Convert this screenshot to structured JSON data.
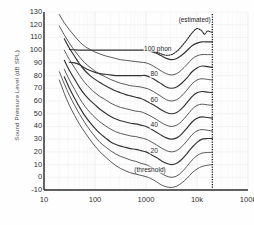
{
  "chart_data": {
    "type": "line",
    "title": "",
    "xlabel": "",
    "ylabel": "Sound Pressure Level (dB SPL)",
    "xscale": "log",
    "xlim": [
      10,
      100000
    ],
    "ylim": [
      -10,
      130
    ],
    "grid": true,
    "legend": "none",
    "xticks": [
      {
        "value": 10,
        "label": "10"
      },
      {
        "value": 100,
        "label": "100"
      },
      {
        "value": 1000,
        "label": "1000"
      },
      {
        "value": 10000,
        "label": "10k"
      },
      {
        "value": 100000,
        "label": "100k"
      }
    ],
    "yticks": [
      {
        "value": 130,
        "label": "130"
      },
      {
        "value": 120,
        "label": "120"
      },
      {
        "value": 110,
        "label": "110"
      },
      {
        "value": 100,
        "label": "100"
      },
      {
        "value": 90,
        "label": "90"
      },
      {
        "value": 80,
        "label": "80"
      },
      {
        "value": 70,
        "label": "70"
      },
      {
        "value": 60,
        "label": "60"
      },
      {
        "value": 50,
        "label": "50"
      },
      {
        "value": 40,
        "label": "40"
      },
      {
        "value": 30,
        "label": "30"
      },
      {
        "value": 20,
        "label": "20"
      },
      {
        "value": 10,
        "label": "10"
      },
      {
        "value": 0,
        "label": "0"
      },
      {
        "value": -10,
        "label": "-10"
      }
    ],
    "annotations": [
      {
        "name": "estimated-note",
        "text": "(estimated)",
        "x": 9000,
        "y": 124
      },
      {
        "name": "label-100-phon",
        "text": "100 phon",
        "x": 1700,
        "y": 101
      },
      {
        "name": "label-80-phon",
        "text": "80",
        "x": 1450,
        "y": 81
      },
      {
        "name": "label-60-phon",
        "text": "60",
        "x": 1450,
        "y": 61
      },
      {
        "name": "label-40-phon",
        "text": "40",
        "x": 1450,
        "y": 41
      },
      {
        "name": "label-20-phon",
        "text": "20",
        "x": 1450,
        "y": 21
      },
      {
        "name": "label-threshold",
        "text": "(threshold)",
        "x": 1200,
        "y": 6
      }
    ],
    "series": [
      {
        "name": "100 phon",
        "style": "solid",
        "x": [
          31.5,
          40,
          50,
          63,
          80,
          100,
          125,
          160,
          200,
          250,
          315,
          400,
          500,
          630,
          800,
          1000,
          1250,
          1600,
          2000,
          2500,
          3150,
          4000,
          5000,
          6300,
          8000,
          10000,
          12500,
          16000,
          20000
        ],
        "values": [
          100.5,
          100.2,
          100.0,
          100.0,
          100.0,
          100.0,
          100.0,
          100.0,
          100.0,
          100.0,
          100.0,
          100.0,
          100.0,
          100.0,
          100.0,
          100.0,
          99.0,
          97.5,
          95.5,
          93.5,
          92.5,
          93.5,
          96.0,
          99.5,
          103.5,
          105.5,
          106.5,
          106.5,
          106.5
        ]
      },
      {
        "name": "100 phon estimated",
        "style": "dotted",
        "x": [
          1000,
          1250,
          1600,
          2000,
          2500,
          3150,
          4000,
          5000,
          6300,
          8000,
          10000,
          12500,
          14000,
          16000,
          18000,
          20000
        ],
        "values": [
          100.0,
          99.5,
          98.5,
          97.0,
          96.0,
          96.5,
          99.0,
          103.0,
          108.0,
          113.5,
          117.0,
          115.0,
          112.5,
          115.0,
          114.5,
          114.0
        ]
      },
      {
        "name": "90 phon",
        "style": "solid",
        "x": [
          20,
          25,
          31.5,
          40,
          50,
          63,
          80,
          100,
          125,
          160,
          200,
          250,
          315,
          400,
          500,
          630,
          800,
          1000,
          1250,
          1600,
          2000,
          2500,
          3150,
          4000,
          5000,
          6300,
          8000,
          10000,
          12500,
          16000,
          20000
        ],
        "values": [
          128.0,
          121.5,
          116.0,
          111.0,
          106.5,
          103.0,
          100.5,
          98.5,
          97.0,
          95.5,
          94.5,
          93.5,
          92.5,
          92.0,
          91.5,
          91.0,
          90.5,
          90.0,
          88.5,
          86.0,
          83.5,
          81.5,
          80.5,
          81.5,
          84.5,
          88.5,
          93.0,
          95.5,
          96.5,
          96.5,
          96.5
        ]
      },
      {
        "name": "80 phon",
        "style": "solid",
        "x": [
          31.5,
          40,
          50,
          63,
          80,
          100,
          125,
          160,
          200,
          250,
          315,
          400,
          500,
          630,
          800,
          1000,
          1250,
          1600,
          2000,
          2500,
          3150,
          4000,
          5000,
          6300,
          8000,
          10000,
          12500,
          16000,
          20000
        ],
        "values": [
          90.5,
          90.0,
          88.5,
          86.0,
          84.0,
          82.5,
          81.5,
          81.0,
          80.5,
          80.0,
          80.0,
          80.0,
          80.0,
          80.0,
          80.0,
          80.0,
          78.5,
          76.0,
          73.5,
          71.0,
          70.0,
          71.0,
          74.0,
          78.0,
          83.0,
          86.0,
          87.5,
          87.0,
          86.5
        ]
      },
      {
        "name": "70 phon",
        "style": "solid",
        "x": [
          20,
          25,
          31.5,
          40,
          50,
          63,
          80,
          100,
          125,
          160,
          200,
          250,
          315,
          400,
          500,
          630,
          800,
          1000,
          1250,
          1600,
          2000,
          2500,
          3150,
          4000,
          5000,
          6300,
          8000,
          10000,
          12500,
          16000,
          20000
        ],
        "values": [
          119.0,
          112.0,
          105.5,
          99.5,
          94.5,
          90.0,
          86.5,
          83.5,
          81.0,
          79.0,
          77.0,
          75.5,
          74.0,
          73.0,
          72.0,
          71.5,
          71.0,
          70.0,
          68.5,
          66.0,
          63.5,
          61.0,
          60.0,
          61.0,
          64.0,
          68.5,
          73.5,
          76.5,
          77.5,
          77.0,
          76.5
        ]
      },
      {
        "name": "60 phon",
        "style": "solid",
        "x": [
          25,
          31.5,
          40,
          50,
          63,
          80,
          100,
          125,
          160,
          200,
          250,
          315,
          400,
          500,
          630,
          800,
          1000,
          1250,
          1600,
          2000,
          2500,
          3150,
          4000,
          5000,
          6300,
          8000,
          10000,
          12500,
          16000,
          20000
        ],
        "values": [
          109.0,
          101.5,
          95.0,
          89.0,
          84.0,
          80.0,
          77.0,
          74.5,
          72.0,
          70.0,
          68.0,
          66.5,
          65.0,
          64.0,
          63.0,
          62.0,
          60.0,
          58.0,
          55.5,
          53.0,
          51.0,
          50.0,
          51.0,
          54.0,
          58.5,
          63.5,
          66.5,
          67.5,
          67.0,
          66.5
        ]
      },
      {
        "name": "50 phon",
        "style": "solid",
        "x": [
          25,
          31.5,
          40,
          50,
          63,
          80,
          100,
          125,
          160,
          200,
          250,
          315,
          400,
          500,
          630,
          800,
          1000,
          1250,
          1600,
          2000,
          2500,
          3150,
          4000,
          5000,
          6300,
          8000,
          10000,
          12500,
          16000,
          20000
        ],
        "values": [
          100.0,
          92.5,
          86.0,
          80.0,
          74.5,
          70.0,
          66.5,
          63.5,
          61.0,
          58.5,
          56.5,
          55.0,
          54.0,
          53.0,
          52.0,
          51.5,
          50.0,
          48.0,
          45.5,
          43.0,
          41.0,
          40.0,
          41.0,
          44.0,
          48.5,
          53.5,
          56.5,
          57.5,
          57.0,
          56.5
        ]
      },
      {
        "name": "40 phon",
        "style": "solid",
        "x": [
          25,
          31.5,
          40,
          50,
          63,
          80,
          100,
          125,
          160,
          200,
          250,
          315,
          400,
          500,
          630,
          800,
          1000,
          1250,
          1600,
          2000,
          2500,
          3150,
          4000,
          5000,
          6300,
          8000,
          10000,
          12500,
          16000,
          20000
        ],
        "values": [
          92.0,
          84.0,
          77.0,
          70.5,
          65.0,
          60.5,
          57.0,
          53.5,
          50.5,
          48.0,
          46.0,
          44.5,
          43.5,
          42.5,
          42.0,
          41.0,
          40.0,
          38.0,
          35.5,
          33.0,
          31.0,
          30.0,
          31.0,
          34.0,
          38.5,
          43.5,
          46.5,
          47.5,
          47.0,
          46.5
        ]
      },
      {
        "name": "30 phon",
        "style": "solid",
        "x": [
          25,
          31.5,
          40,
          50,
          63,
          80,
          100,
          125,
          160,
          200,
          250,
          315,
          400,
          500,
          630,
          800,
          1000,
          1250,
          1600,
          2000,
          2500,
          3150,
          4000,
          5000,
          6300,
          8000,
          10000,
          12500,
          16000,
          20000
        ],
        "values": [
          85.0,
          76.5,
          69.0,
          62.0,
          56.0,
          51.0,
          47.0,
          43.5,
          40.5,
          38.0,
          36.0,
          34.5,
          33.5,
          32.5,
          32.0,
          31.0,
          30.0,
          28.0,
          25.5,
          23.0,
          21.0,
          20.0,
          21.0,
          24.0,
          28.5,
          33.5,
          36.5,
          37.5,
          37.0,
          36.5
        ]
      },
      {
        "name": "20 phon",
        "style": "solid",
        "x": [
          25,
          31.5,
          40,
          50,
          63,
          80,
          100,
          125,
          160,
          200,
          250,
          315,
          400,
          500,
          630,
          800,
          1000,
          1250,
          1600,
          2000,
          2500,
          3150,
          4000,
          5000,
          6300,
          8000,
          10000,
          12500,
          16000,
          20000
        ],
        "values": [
          79.0,
          70.0,
          62.0,
          55.0,
          48.5,
          43.0,
          38.5,
          34.5,
          31.0,
          28.0,
          26.0,
          24.5,
          23.5,
          22.5,
          22.0,
          21.0,
          20.0,
          18.0,
          15.5,
          13.0,
          11.0,
          10.0,
          11.0,
          14.0,
          18.5,
          23.5,
          27.5,
          30.0,
          30.5,
          30.5
        ]
      },
      {
        "name": "10 phon",
        "style": "solid",
        "x": [
          20,
          25,
          31.5,
          40,
          50,
          63,
          80,
          100,
          125,
          160,
          200,
          250,
          315,
          400,
          500,
          630,
          800,
          1000,
          1250,
          1600,
          2000,
          2500,
          3150,
          4000,
          5000,
          6300,
          8000,
          10000,
          12500,
          16000,
          20000
        ],
        "values": [
          83.0,
          73.5,
          64.5,
          56.5,
          49.5,
          43.0,
          37.0,
          32.0,
          27.5,
          24.0,
          21.0,
          18.5,
          16.5,
          15.0,
          13.5,
          12.5,
          11.0,
          10.0,
          8.0,
          5.5,
          3.0,
          1.0,
          0.0,
          1.0,
          4.0,
          8.5,
          13.5,
          17.0,
          19.0,
          19.5,
          19.5
        ]
      },
      {
        "name": "threshold",
        "style": "solid",
        "x": [
          20,
          25,
          31.5,
          40,
          50,
          63,
          80,
          100,
          125,
          160,
          200,
          250,
          315,
          400,
          500,
          630,
          800,
          1000,
          1250,
          1600,
          2000,
          2500,
          3150,
          4000,
          5000,
          6300,
          8000,
          10000,
          12500,
          16000,
          20000
        ],
        "values": [
          76.5,
          66.0,
          56.5,
          48.5,
          41.5,
          35.5,
          29.5,
          24.5,
          20.0,
          16.0,
          12.5,
          9.5,
          7.0,
          5.0,
          3.5,
          2.5,
          1.5,
          0.5,
          -1.0,
          -3.5,
          -6.0,
          -7.5,
          -8.0,
          -7.0,
          -4.5,
          -1.0,
          3.5,
          6.5,
          8.5,
          9.5,
          10.0
        ]
      }
    ],
    "vertical_limit": {
      "name": "upper-frequency-limit",
      "x": 20000,
      "style": "dotted"
    }
  }
}
